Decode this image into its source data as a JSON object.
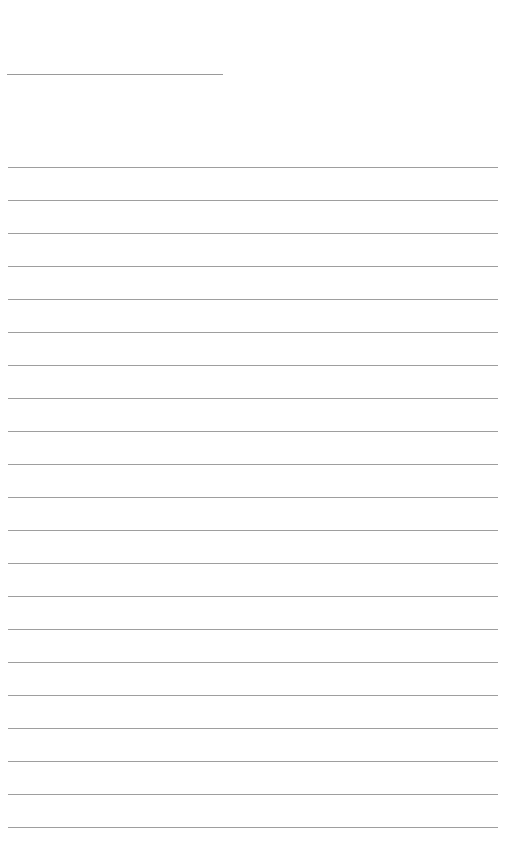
{
  "page": {
    "type": "lined-paper",
    "background_color": "#ffffff",
    "line_color": "#9e9e9e",
    "title_line": {
      "x": 7,
      "y": 74,
      "width": 216
    },
    "rules": {
      "count": 21,
      "start_y": 167,
      "spacing": 33,
      "x": 8,
      "width": 490
    }
  }
}
